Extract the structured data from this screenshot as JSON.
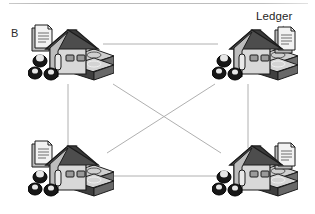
{
  "figure": {
    "panel_label": "B",
    "background": "#ffffff",
    "top_rule_color": "#c0c0c0",
    "annotation": {
      "label": "Ledger",
      "points_to": "node-top-right-ledger-icon",
      "color": "#1f1f1f"
    }
  },
  "palette": {
    "edge_line": "#b0b0b0",
    "roof_dark": "#4d4d4d",
    "roof_shadow": "#3a3a3a",
    "wall_light": "#d8d8d8",
    "wall_mid": "#bdbdbd",
    "wall_shade": "#9a9a9a",
    "outline": "#1c1c1c",
    "money_band": "#4a4a4a",
    "money_light": "#cfcfcf",
    "coin_dark": "#171717",
    "paper_white": "#f2f2f2",
    "paper_grey": "#b9b9b9"
  },
  "nodes": [
    {
      "id": "node-top-left",
      "name": "property-node-top-left",
      "x": 28,
      "y": 24,
      "ledger_icon": "ledger-document-icon",
      "money_icon": "cash-stack-icon",
      "coins_icon": "coin-stack-icon",
      "house_icon": "house-icon"
    },
    {
      "id": "node-top-right",
      "name": "property-node-top-right",
      "x": 212,
      "y": 24,
      "ledger_icon": "ledger-document-icon",
      "money_icon": "cash-stack-icon",
      "coins_icon": "coin-stack-icon",
      "house_icon": "house-icon"
    },
    {
      "id": "node-bottom-left",
      "name": "property-node-bottom-left",
      "x": 28,
      "y": 140,
      "ledger_icon": "ledger-document-icon",
      "money_icon": "cash-stack-icon",
      "coins_icon": "coin-stack-icon",
      "house_icon": "house-icon"
    },
    {
      "id": "node-bottom-right",
      "name": "property-node-bottom-right",
      "x": 212,
      "y": 140,
      "ledger_icon": "ledger-document-icon",
      "money_icon": "cash-stack-icon",
      "coins_icon": "coin-stack-icon",
      "house_icon": "house-icon"
    }
  ],
  "edges": [
    {
      "id": "edge-top",
      "from": "node-top-left",
      "to": "node-top-right",
      "x1": 103,
      "y1": 44,
      "x2": 218,
      "y2": 44
    },
    {
      "id": "edge-bottom",
      "from": "node-bottom-left",
      "to": "node-bottom-right",
      "x1": 112,
      "y1": 176,
      "x2": 230,
      "y2": 176
    },
    {
      "id": "edge-left",
      "from": "node-top-left",
      "to": "node-bottom-left",
      "x1": 68,
      "y1": 84,
      "x2": 68,
      "y2": 148
    },
    {
      "id": "edge-right",
      "from": "node-top-right",
      "to": "node-bottom-right",
      "x1": 248,
      "y1": 84,
      "x2": 248,
      "y2": 148
    },
    {
      "id": "edge-diagonal-down",
      "from": "node-top-left",
      "to": "node-bottom-right",
      "x1": 113,
      "y1": 84,
      "x2": 221,
      "y2": 153
    },
    {
      "id": "edge-diagonal-up",
      "from": "node-bottom-left",
      "to": "node-top-right",
      "x1": 107,
      "y1": 153,
      "x2": 215,
      "y2": 84
    }
  ],
  "annotation_leader": {
    "x1": 283,
    "y1": 26,
    "x2": 274,
    "y2": 34
  }
}
